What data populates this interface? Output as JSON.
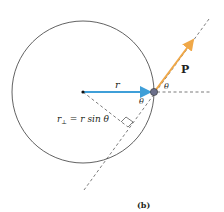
{
  "figure": {
    "caption": "(b)",
    "labels": {
      "radius": "r",
      "momentum": "P",
      "angle_outer": "θ",
      "angle_inner": "θ",
      "perp_lhs": "r",
      "perp_sub": "⊥",
      "perp_rhs": " = r sin θ"
    },
    "colors": {
      "radius_arrow": "#3f9fd8",
      "momentum_arrow": "#f0a848",
      "circle": "#3a3a3a",
      "particle": "#6b6f8a",
      "text": "#231f20"
    },
    "geometry": {
      "center": [
        83,
        92
      ],
      "radius": 71,
      "particle": [
        154,
        92
      ]
    }
  }
}
